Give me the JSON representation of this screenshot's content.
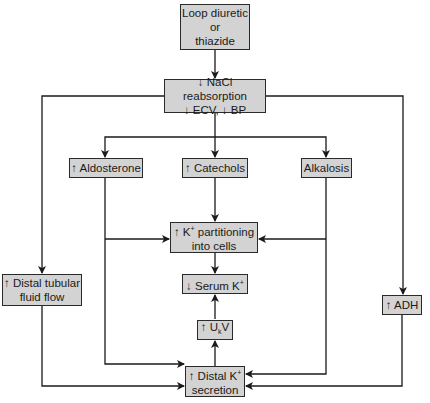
{
  "diagram": {
    "nodes": {
      "loop_diuretic": {
        "line1": "Loop diuretic",
        "line2": "or",
        "line3": "thiazide"
      },
      "nacl": {
        "line1": "↓ NaCl reabsorption",
        "line2": "↓ ECV, ↓ BP"
      },
      "aldosterone": {
        "label": "↑ Aldosterone"
      },
      "catechols": {
        "label": "↑ Catechols"
      },
      "alkalosis": {
        "label": "Alkalosis"
      },
      "k_partition": {
        "line1_prefix": "↑ K",
        "line1_sup": "+",
        "line1_suffix": " partitioning",
        "line2": "into cells"
      },
      "serum_k": {
        "prefix": "↓ Serum K",
        "sup": "+"
      },
      "ukv": {
        "prefix": "↑ U",
        "sub": "k",
        "suffix": "V"
      },
      "distal_k": {
        "line1_prefix": "↑ Distal K",
        "line1_sup": "+",
        "line2": "secretion"
      },
      "distal_flow": {
        "line1": "↑ Distal tubular",
        "line2": "fluid flow"
      },
      "adh": {
        "label": "↑ ADH"
      }
    },
    "edges": [
      {
        "from": "loop_diuretic",
        "to": "nacl"
      },
      {
        "from": "nacl",
        "to": "aldosterone"
      },
      {
        "from": "nacl",
        "to": "catechols"
      },
      {
        "from": "nacl",
        "to": "alkalosis"
      },
      {
        "from": "nacl",
        "to": "distal_flow"
      },
      {
        "from": "nacl",
        "to": "adh"
      },
      {
        "from": "aldosterone",
        "to": "k_partition"
      },
      {
        "from": "catechols",
        "to": "k_partition"
      },
      {
        "from": "alkalosis",
        "to": "k_partition"
      },
      {
        "from": "k_partition",
        "to": "serum_k"
      },
      {
        "from": "ukv",
        "to": "serum_k"
      },
      {
        "from": "distal_k",
        "to": "ukv"
      },
      {
        "from": "aldosterone",
        "to": "distal_k"
      },
      {
        "from": "distal_flow",
        "to": "distal_k"
      },
      {
        "from": "alkalosis",
        "to": "distal_k"
      },
      {
        "from": "adh",
        "to": "distal_k"
      }
    ],
    "colors": {
      "box_fill": "#d3d3d3",
      "line": "#1a1a1a"
    }
  }
}
